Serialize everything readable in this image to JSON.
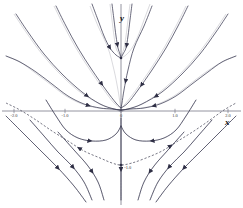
{
  "figure": {
    "kind": "phase-portrait",
    "background_color": "#ffffff",
    "curve_color": "#3a3a52",
    "axis_color": "#7a7a88",
    "dashed_color": "#555566",
    "width": 243,
    "height": 208
  },
  "axes": {
    "x_label": "x",
    "y_label": "y",
    "x_ticks": [
      {
        "value": "-2.0",
        "px": 14
      },
      {
        "value": "-1.0",
        "px": 65
      },
      {
        "value": "0",
        "px": 121
      },
      {
        "value": "1.0",
        "px": 175
      },
      {
        "value": "2.0",
        "px": 228
      }
    ],
    "y_ticks": [
      {
        "value": "0",
        "px": 111
      },
      {
        "value": "-1.0",
        "px": 165
      }
    ],
    "x_axis_y_px": 111,
    "y_axis_x_px": 121,
    "xlim": [
      -2.2,
      2.2
    ],
    "ylim": [
      -1.6,
      2.3
    ]
  },
  "chart_data": {
    "type": "line",
    "title": "",
    "xlabel": "x",
    "ylabel": "y",
    "grid": false,
    "legend": false,
    "xlim": [
      -2.2,
      2.2
    ],
    "ylim": [
      -1.6,
      2.3
    ],
    "features": [
      {
        "name": "stable-node",
        "kind": "critical-point",
        "x": 0.0,
        "y": 1.0,
        "px": [
          121,
          58
        ],
        "description": "attracting node; many trajectories converge inward"
      },
      {
        "name": "saddle-point",
        "kind": "critical-point",
        "x": 0.0,
        "y": -1.0,
        "px": [
          121,
          165
        ],
        "description": "saddle on the dashed separatrix"
      }
    ],
    "separatrix": {
      "style": "dashed",
      "points_px": [
        [
          6,
          103
        ],
        [
          20,
          110
        ],
        [
          36,
          120
        ],
        [
          52,
          131
        ],
        [
          68,
          141
        ],
        [
          84,
          151
        ],
        [
          100,
          158
        ],
        [
          112,
          163
        ],
        [
          121,
          165
        ],
        [
          132,
          163
        ],
        [
          146,
          158
        ],
        [
          162,
          151
        ],
        [
          178,
          141
        ],
        [
          194,
          131
        ],
        [
          210,
          120
        ],
        [
          224,
          110
        ],
        [
          236,
          103
        ]
      ]
    },
    "trajectories": [
      {
        "id": "t1",
        "points_px": [
          [
            16,
            14
          ],
          [
            28,
            32
          ],
          [
            44,
            54
          ],
          [
            62,
            74
          ],
          [
            82,
            92
          ],
          [
            100,
            104
          ],
          [
            114,
            109
          ],
          [
            121,
            110
          ]
        ]
      },
      {
        "id": "t2",
        "points_px": [
          [
            56,
            6
          ],
          [
            66,
            26
          ],
          [
            78,
            48
          ],
          [
            92,
            70
          ],
          [
            106,
            90
          ],
          [
            116,
            103
          ],
          [
            121,
            108
          ]
        ]
      },
      {
        "id": "t3",
        "points_px": [
          [
            92,
            4
          ],
          [
            98,
            20
          ],
          [
            104,
            36
          ],
          [
            110,
            48
          ],
          [
            116,
            55
          ],
          [
            121,
            58
          ]
        ]
      },
      {
        "id": "t4",
        "points_px": [
          [
            112,
            4
          ],
          [
            114,
            20
          ],
          [
            116,
            36
          ],
          [
            118,
            48
          ],
          [
            120,
            54
          ],
          [
            121,
            58
          ]
        ]
      },
      {
        "id": "t5",
        "points_px": [
          [
            132,
            4
          ],
          [
            130,
            20
          ],
          [
            128,
            36
          ],
          [
            126,
            48
          ],
          [
            123,
            54
          ],
          [
            121,
            58
          ]
        ]
      },
      {
        "id": "t6",
        "points_px": [
          [
            152,
            6
          ],
          [
            144,
            26
          ],
          [
            134,
            48
          ],
          [
            128,
            70
          ],
          [
            124,
            90
          ],
          [
            122,
            103
          ],
          [
            121,
            108
          ]
        ]
      },
      {
        "id": "t7",
        "points_px": [
          [
            188,
            6
          ],
          [
            178,
            26
          ],
          [
            166,
            48
          ],
          [
            152,
            70
          ],
          [
            138,
            90
          ],
          [
            128,
            103
          ],
          [
            121,
            108
          ]
        ]
      },
      {
        "id": "t8",
        "points_px": [
          [
            228,
            14
          ],
          [
            216,
            32
          ],
          [
            200,
            54
          ],
          [
            182,
            74
          ],
          [
            162,
            92
          ],
          [
            142,
            104
          ],
          [
            128,
            109
          ],
          [
            121,
            110
          ]
        ]
      },
      {
        "id": "t9",
        "points_px": [
          [
            6,
            56
          ],
          [
            20,
            62
          ],
          [
            36,
            72
          ],
          [
            52,
            84
          ],
          [
            68,
            96
          ],
          [
            84,
            104
          ],
          [
            100,
            108
          ],
          [
            112,
            109
          ],
          [
            121,
            110
          ]
        ]
      },
      {
        "id": "t10",
        "points_px": [
          [
            236,
            56
          ],
          [
            222,
            62
          ],
          [
            208,
            72
          ],
          [
            192,
            84
          ],
          [
            176,
            96
          ],
          [
            160,
            104
          ],
          [
            144,
            108
          ],
          [
            130,
            109
          ],
          [
            121,
            110
          ]
        ]
      },
      {
        "id": "t11",
        "points_px": [
          [
            46,
            100
          ],
          [
            56,
            116
          ],
          [
            66,
            130
          ],
          [
            78,
            138
          ],
          [
            92,
            141
          ],
          [
            106,
            140
          ],
          [
            116,
            134
          ],
          [
            121,
            126
          ]
        ]
      },
      {
        "id": "t12",
        "points_px": [
          [
            196,
            100
          ],
          [
            186,
            116
          ],
          [
            176,
            130
          ],
          [
            164,
            138
          ],
          [
            150,
            141
          ],
          [
            136,
            140
          ],
          [
            126,
            134
          ],
          [
            121,
            126
          ]
        ]
      },
      {
        "id": "t13",
        "points_px": [
          [
            30,
            120
          ],
          [
            44,
            136
          ],
          [
            58,
            152
          ],
          [
            72,
            166
          ],
          [
            84,
            182
          ],
          [
            92,
            200
          ]
        ]
      },
      {
        "id": "t14",
        "points_px": [
          [
            212,
            120
          ],
          [
            198,
            136
          ],
          [
            184,
            152
          ],
          [
            170,
            166
          ],
          [
            158,
            182
          ],
          [
            150,
            200
          ]
        ]
      },
      {
        "id": "t15",
        "points_px": [
          [
            58,
            132
          ],
          [
            74,
            150
          ],
          [
            88,
            166
          ],
          [
            98,
            182
          ],
          [
            104,
            200
          ]
        ]
      },
      {
        "id": "t16",
        "points_px": [
          [
            184,
            132
          ],
          [
            168,
            150
          ],
          [
            154,
            166
          ],
          [
            144,
            182
          ],
          [
            138,
            200
          ]
        ]
      },
      {
        "id": "t17",
        "points_px": [
          [
            6,
            116
          ],
          [
            22,
            132
          ],
          [
            40,
            150
          ],
          [
            58,
            168
          ],
          [
            74,
            186
          ],
          [
            86,
            202
          ]
        ]
      },
      {
        "id": "t18",
        "points_px": [
          [
            236,
            116
          ],
          [
            220,
            132
          ],
          [
            202,
            150
          ],
          [
            184,
            168
          ],
          [
            168,
            186
          ],
          [
            156,
            202
          ]
        ]
      },
      {
        "id": "t19",
        "points_px": [
          [
            121,
            118
          ],
          [
            121,
            140
          ],
          [
            121,
            160
          ],
          [
            121,
            180
          ],
          [
            121,
            200
          ]
        ]
      }
    ],
    "arrow_count": 34,
    "flow_direction": "toward the node at (0,1) in the upper region; away from the saddle along the dashed separatrix"
  }
}
